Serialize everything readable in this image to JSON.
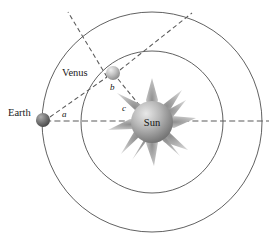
{
  "diagram": {
    "type": "orbital-geometry",
    "background_color": "#ffffff",
    "orbit_stroke_color": "#4a4a4a",
    "dashed_line_color": "#5a5a5a"
  },
  "bodies": {
    "sun": {
      "label": "Sun",
      "cx": 152,
      "cy": 122,
      "radius": 21,
      "ray_count": 11,
      "ray_length": 22,
      "color_light": "#d8d8d8",
      "color_dark": "#6f6f6f"
    },
    "venus": {
      "label": "Venus",
      "cx": 113,
      "cy": 73,
      "radius": 7,
      "label_x": 62,
      "label_y": 76,
      "color_light": "#e2e2e2",
      "color_dark": "#8c8c8c"
    },
    "earth": {
      "label": "Earth",
      "cx": 43,
      "cy": 120,
      "radius": 7,
      "label_x": 8,
      "label_y": 116,
      "color_light": "#9a9a9a",
      "color_dark": "#4a4a4a"
    }
  },
  "orbits": [
    {
      "name": "earth-orbit",
      "cx": 152,
      "cy": 122,
      "r": 110
    },
    {
      "name": "venus-orbit",
      "cx": 152,
      "cy": 122,
      "r": 71
    }
  ],
  "angles": [
    {
      "id": "a",
      "label": "a",
      "vertex": "earth",
      "x": 62,
      "y": 117
    },
    {
      "id": "b",
      "label": "b",
      "vertex": "venus",
      "x": 110,
      "y": 90
    },
    {
      "id": "c",
      "label": "c",
      "vertex": "sun",
      "x": 122,
      "y": 111
    }
  ],
  "sight_lines": [
    {
      "name": "earth-venus-line",
      "from": "earth",
      "to": "venus",
      "style": "dashed"
    },
    {
      "name": "earth-sun-line",
      "from": "earth",
      "to": "sun",
      "style": "dash-dot",
      "extends": "right-edge"
    },
    {
      "name": "venus-sun-line",
      "from": "venus",
      "to": "sun",
      "style": "dashed"
    },
    {
      "name": "venus-upper-left-ray",
      "from": "venus",
      "direction": "upper-left",
      "style": "dashed"
    },
    {
      "name": "venus-upper-right-ray",
      "from": "venus",
      "direction": "upper-right",
      "style": "dashed"
    }
  ]
}
